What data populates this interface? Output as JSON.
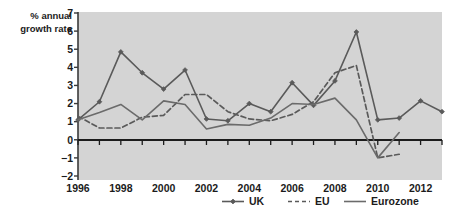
{
  "chart_data": {
    "type": "line",
    "title": "",
    "subtitle": "",
    "ylabel": "% annual growth rate",
    "ylabel_line1": "% annual",
    "ylabel_line2": "growth rate",
    "xlabel": "",
    "ylim": [
      -2,
      7
    ],
    "ytick_step": 1,
    "yticks": [
      7,
      6,
      5,
      4,
      3,
      2,
      1,
      0,
      -1,
      -2
    ],
    "ytick_labels": [
      "7",
      "6",
      "5",
      "4",
      "3",
      "2",
      "1",
      "0",
      "−1",
      "−2"
    ],
    "xlim": [
      1996,
      2013
    ],
    "x": [
      1996,
      1997,
      1998,
      1999,
      2000,
      2001,
      2002,
      2003,
      2004,
      2005,
      2006,
      2007,
      2008,
      2009,
      2010,
      2011,
      2012,
      2013
    ],
    "xticks": [
      1996,
      1997,
      1998,
      1999,
      2000,
      2001,
      2002,
      2003,
      2004,
      2005,
      2006,
      2007,
      2008,
      2009,
      2010,
      2011,
      2012,
      2013
    ],
    "xtick_labels_shown": [
      "1996",
      "1998",
      "2000",
      "2002",
      "2004",
      "2006",
      "2008",
      "2010",
      "2012"
    ],
    "xtick_labels_values": [
      1996,
      1998,
      2000,
      2002,
      2004,
      2006,
      2008,
      2010,
      2012
    ],
    "grid": false,
    "plot_background": "#d4d4d4",
    "zero_line": 0,
    "legend_position": "bottom",
    "series": [
      {
        "name": "UK",
        "style": "solid-markers",
        "color": "#5a5a5a",
        "marker": "diamond",
        "x": [
          1996,
          1997,
          1998,
          1999,
          2000,
          2001,
          2002,
          2003,
          2004,
          2005,
          2006,
          2007,
          2008,
          2009,
          2010,
          2011,
          2012,
          2013
        ],
        "values": [
          1.1,
          2.1,
          4.85,
          3.7,
          2.8,
          3.85,
          1.15,
          1.05,
          2.0,
          1.55,
          3.15,
          1.9,
          3.25,
          5.95,
          1.1,
          1.2,
          2.15,
          1.55
        ]
      },
      {
        "name": "EU",
        "style": "dashed",
        "color": "#5a5a5a",
        "marker": "none",
        "x": [
          1996,
          1997,
          1998,
          1999,
          2000,
          2001,
          2002,
          2003,
          2004,
          2005,
          2006,
          2007,
          2008,
          2009,
          2010,
          2011
        ],
        "values": [
          1.3,
          0.65,
          0.65,
          1.25,
          1.35,
          2.5,
          2.5,
          1.55,
          1.15,
          1.05,
          1.4,
          2.1,
          3.7,
          4.1,
          -1.0,
          -0.8
        ]
      },
      {
        "name": "Eurozone",
        "style": "solid",
        "color": "#6b6b6b",
        "marker": "none",
        "x": [
          1996,
          1997,
          1998,
          1999,
          2000,
          2001,
          2002,
          2003,
          2004,
          2005,
          2006,
          2007,
          2008,
          2009,
          2010,
          2011
        ],
        "values": [
          1.1,
          1.5,
          1.95,
          1.1,
          2.15,
          1.95,
          0.6,
          0.85,
          0.8,
          1.2,
          2.0,
          1.95,
          2.3,
          1.1,
          -1.0,
          0.4
        ]
      }
    ]
  },
  "legend": {
    "items": [
      {
        "label": "UK",
        "style": "solid-markers"
      },
      {
        "label": "EU",
        "style": "dashed"
      },
      {
        "label": "Eurozone",
        "style": "solid"
      }
    ]
  }
}
